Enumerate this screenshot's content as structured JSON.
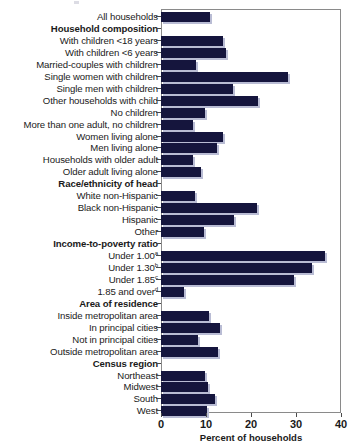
{
  "chart_data": {
    "type": "bar",
    "orientation": "horizontal",
    "title": "",
    "subtitle": "",
    "xlabel": "Percent of households",
    "ylabel": "",
    "xlim": [
      0,
      40
    ],
    "xticks": [
      0,
      10,
      20,
      30,
      40
    ],
    "xtick_labels": [
      "0",
      "10",
      "20",
      "30",
      "40"
    ],
    "grid": false,
    "legend": null,
    "bar_color": "#15153d",
    "shadow_color": "#b9bcd4",
    "frame_color": "#8a8a8a",
    "rows": [
      {
        "label": "All households",
        "value": 10.9,
        "heading": false,
        "superscript": ""
      },
      {
        "label": "Household composition",
        "value": null,
        "heading": true,
        "superscript": ""
      },
      {
        "label": "With children <18 years",
        "value": 13.8,
        "heading": false,
        "superscript": ""
      },
      {
        "label": "With children <6 years",
        "value": 14.4,
        "heading": false,
        "superscript": ""
      },
      {
        "label": "Married-couples with children",
        "value": 7.8,
        "heading": false,
        "superscript": ""
      },
      {
        "label": "Single women with children",
        "value": 28.2,
        "heading": false,
        "superscript": ""
      },
      {
        "label": "Single men with children",
        "value": 16.0,
        "heading": false,
        "superscript": ""
      },
      {
        "label": "Other households with child",
        "value": 21.6,
        "heading": false,
        "superscript": ""
      },
      {
        "label": "No children",
        "value": 9.8,
        "heading": false,
        "superscript": ""
      },
      {
        "label": "More than one adult, no children",
        "value": 7.1,
        "heading": false,
        "superscript": ""
      },
      {
        "label": "Women living alone",
        "value": 13.8,
        "heading": false,
        "superscript": ""
      },
      {
        "label": "Men living alone",
        "value": 12.4,
        "heading": false,
        "superscript": ""
      },
      {
        "label": "Households with older adult",
        "value": 7.1,
        "heading": false,
        "superscript": ""
      },
      {
        "label": "Older adult living alone",
        "value": 8.9,
        "heading": false,
        "superscript": ""
      },
      {
        "label": "Race/ethnicity of head",
        "value": null,
        "heading": true,
        "superscript": ""
      },
      {
        "label": "White non-Hispanic",
        "value": 7.6,
        "heading": false,
        "superscript": ""
      },
      {
        "label": "Black non-Hispanic",
        "value": 21.3,
        "heading": false,
        "superscript": ""
      },
      {
        "label": "Hispanic",
        "value": 16.2,
        "heading": false,
        "superscript": ""
      },
      {
        "label": "Other",
        "value": 9.6,
        "heading": false,
        "superscript": ""
      },
      {
        "label": "Income-to-poverty ratio",
        "value": null,
        "heading": true,
        "superscript": ""
      },
      {
        "label": "Under 1.00",
        "value": 36.4,
        "heading": false,
        "superscript": "a"
      },
      {
        "label": "Under 1.30",
        "value": 33.6,
        "heading": false,
        "superscript": "b"
      },
      {
        "label": "Under 1.85",
        "value": 29.6,
        "heading": false,
        "superscript": "c"
      },
      {
        "label": "1.85 and over",
        "value": 5.1,
        "heading": false,
        "superscript": "d"
      },
      {
        "label": "Area of residence",
        "value": null,
        "heading": true,
        "superscript": ""
      },
      {
        "label": "Inside metropolitan area",
        "value": 10.7,
        "heading": false,
        "superscript": ""
      },
      {
        "label": "In principal cities",
        "value": 13.1,
        "heading": false,
        "superscript": ""
      },
      {
        "label": "Not in principal cities",
        "value": 8.2,
        "heading": false,
        "superscript": ""
      },
      {
        "label": "Outside metropolitan area",
        "value": 12.7,
        "heading": false,
        "superscript": ""
      },
      {
        "label": "Census region",
        "value": null,
        "heading": true,
        "superscript": ""
      },
      {
        "label": "Northeast",
        "value": 9.8,
        "heading": false,
        "superscript": ""
      },
      {
        "label": "Midwest",
        "value": 10.4,
        "heading": false,
        "superscript": ""
      },
      {
        "label": "South",
        "value": 12.0,
        "heading": false,
        "superscript": ""
      },
      {
        "label": "West",
        "value": 10.2,
        "heading": false,
        "superscript": ""
      }
    ]
  }
}
